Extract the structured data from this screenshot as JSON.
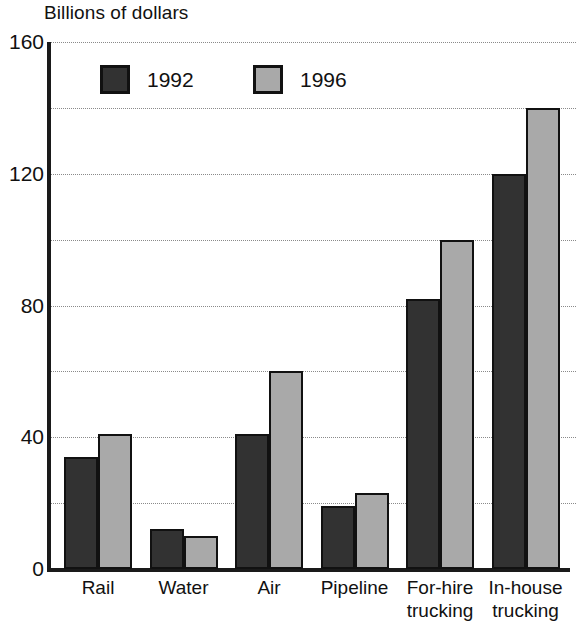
{
  "chart_data": {
    "type": "bar",
    "title": "Billions of dollars",
    "xlabel": "",
    "ylabel": "Billions of dollars",
    "ylim": [
      0,
      160
    ],
    "yticks": [
      0,
      40,
      80,
      120,
      160
    ],
    "gridlines": [
      0,
      20,
      40,
      60,
      80,
      100,
      120,
      140,
      160
    ],
    "grid": true,
    "legend_position": "top-left-inside",
    "categories": [
      "Rail",
      "Water",
      "Air",
      "Pipeline",
      "For-hire trucking",
      "In-house trucking"
    ],
    "category_labels": [
      "Rail",
      "Water",
      "Air",
      "Pipeline",
      "For-hire\ntrucking",
      "In-house\ntrucking"
    ],
    "series": [
      {
        "name": "1992",
        "color": "#323232",
        "values": [
          34,
          12,
          41,
          19,
          82,
          120
        ]
      },
      {
        "name": "1996",
        "color": "#a9a9a9",
        "values": [
          41,
          10,
          60,
          23,
          100,
          140
        ]
      }
    ]
  },
  "legend": {
    "items": [
      {
        "label": "1992",
        "swatch": "legend-swatch-1992"
      },
      {
        "label": "1996",
        "swatch": "legend-swatch-1996"
      }
    ]
  },
  "axis": {
    "y_tick_labels": [
      "160",
      "120",
      "80",
      "40",
      "0"
    ]
  }
}
